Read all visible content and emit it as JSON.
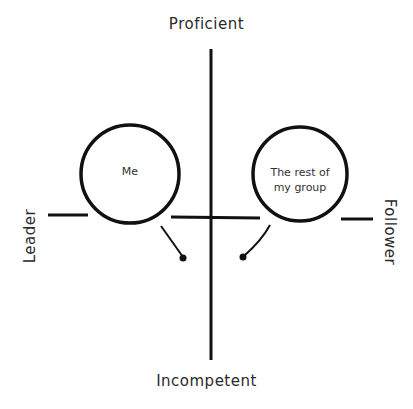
{
  "diagram": {
    "type": "quadrant",
    "axes": {
      "top": "Proficient",
      "bottom": "Incompetent",
      "left": "Leader",
      "right": "Follower"
    },
    "nodes": [
      {
        "id": "me",
        "label": "Me",
        "quadrant": "Leader / Proficient"
      },
      {
        "id": "rest",
        "label_line1": "The rest of",
        "label_line2": "my group",
        "quadrant": "Follower / Proficient"
      }
    ],
    "colors": {
      "line": "#111111",
      "background": "#ffffff",
      "text": "#2a2a2a"
    }
  }
}
